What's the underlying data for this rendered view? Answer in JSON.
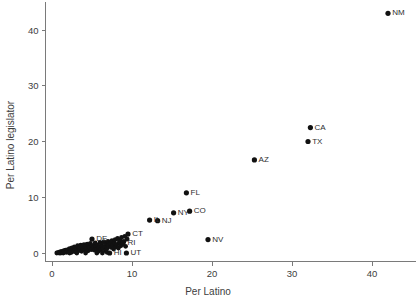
{
  "chart_data": {
    "type": "scatter",
    "title": "",
    "xlabel": "Per Latino",
    "ylabel": "Per Latino legislator",
    "xlim": [
      -0.8,
      45.5
    ],
    "ylim": [
      -1.6,
      45.0
    ],
    "xticks": [
      0,
      10,
      20,
      30,
      40
    ],
    "yticks": [
      0,
      10,
      20,
      30,
      40
    ],
    "xtick_labels": [
      "0",
      "10",
      "20",
      "30",
      "40"
    ],
    "ytick_labels": [
      "0",
      "10",
      "20",
      "30",
      "40"
    ],
    "grid": false,
    "legend": "none",
    "marker": "filled-circle",
    "marker_color": "#111111",
    "axis_color": "#7a7a7a",
    "background": "#ffffff",
    "points": [
      {
        "label": "NM",
        "x": 42.0,
        "y": 43.0
      },
      {
        "label": "CA",
        "x": 32.3,
        "y": 22.5
      },
      {
        "label": "TX",
        "x": 32.0,
        "y": 20.0
      },
      {
        "label": "AZ",
        "x": 25.3,
        "y": 16.7
      },
      {
        "label": "FL",
        "x": 16.8,
        "y": 10.8
      },
      {
        "label": "CO",
        "x": 17.2,
        "y": 7.5
      },
      {
        "label": "NY",
        "x": 15.2,
        "y": 7.2
      },
      {
        "label": "NJ",
        "x": 13.2,
        "y": 5.8
      },
      {
        "label": "IL",
        "x": 12.2,
        "y": 5.9
      },
      {
        "label": "NV",
        "x": 19.5,
        "y": 2.4
      },
      {
        "label": "CT",
        "x": 9.5,
        "y": 3.4
      },
      {
        "label": "RI",
        "x": 8.9,
        "y": 1.9
      },
      {
        "label": "DE",
        "x": 5.0,
        "y": 2.5
      },
      {
        "label": "HI",
        "x": 7.2,
        "y": 0.0
      },
      {
        "label": "UT",
        "x": 9.3,
        "y": 0.0
      }
    ],
    "unlabeled_points": [
      {
        "x": 0.6,
        "y": 0.0
      },
      {
        "x": 0.8,
        "y": 0.1
      },
      {
        "x": 0.9,
        "y": 0.0
      },
      {
        "x": 1.0,
        "y": 0.2
      },
      {
        "x": 1.1,
        "y": 0.0
      },
      {
        "x": 1.2,
        "y": 0.3
      },
      {
        "x": 1.3,
        "y": 0.1
      },
      {
        "x": 1.4,
        "y": 0.0
      },
      {
        "x": 1.5,
        "y": 0.4
      },
      {
        "x": 1.6,
        "y": 0.2
      },
      {
        "x": 1.7,
        "y": 0.5
      },
      {
        "x": 1.8,
        "y": 0.1
      },
      {
        "x": 1.9,
        "y": 0.3
      },
      {
        "x": 2.0,
        "y": 0.6
      },
      {
        "x": 2.1,
        "y": 0.2
      },
      {
        "x": 2.2,
        "y": 0.8
      },
      {
        "x": 2.3,
        "y": 0.4
      },
      {
        "x": 2.4,
        "y": 0.1
      },
      {
        "x": 2.5,
        "y": 0.9
      },
      {
        "x": 2.6,
        "y": 0.5
      },
      {
        "x": 2.7,
        "y": 0.3
      },
      {
        "x": 2.8,
        "y": 1.1
      },
      {
        "x": 2.9,
        "y": 0.6
      },
      {
        "x": 3.0,
        "y": 0.2
      },
      {
        "x": 3.1,
        "y": 0.8
      },
      {
        "x": 3.2,
        "y": 1.3
      },
      {
        "x": 3.3,
        "y": 0.4
      },
      {
        "x": 3.4,
        "y": 0.9
      },
      {
        "x": 3.5,
        "y": 0.6
      },
      {
        "x": 3.6,
        "y": 1.4
      },
      {
        "x": 3.7,
        "y": 0.3
      },
      {
        "x": 3.8,
        "y": 1.0
      },
      {
        "x": 3.9,
        "y": 0.7
      },
      {
        "x": 4.0,
        "y": 1.5
      },
      {
        "x": 4.1,
        "y": 0.5
      },
      {
        "x": 4.2,
        "y": 1.1
      },
      {
        "x": 4.3,
        "y": 0.8
      },
      {
        "x": 4.4,
        "y": 1.6
      },
      {
        "x": 4.5,
        "y": 0.4
      },
      {
        "x": 4.6,
        "y": 1.2
      },
      {
        "x": 4.7,
        "y": 0.9
      },
      {
        "x": 4.8,
        "y": 1.7
      },
      {
        "x": 4.9,
        "y": 0.6
      },
      {
        "x": 5.1,
        "y": 1.3
      },
      {
        "x": 5.2,
        "y": 1.0
      },
      {
        "x": 5.3,
        "y": 0.5
      },
      {
        "x": 5.4,
        "y": 1.8
      },
      {
        "x": 5.5,
        "y": 1.1
      },
      {
        "x": 5.6,
        "y": 0.7
      },
      {
        "x": 5.7,
        "y": 1.4
      },
      {
        "x": 5.8,
        "y": 0.3
      },
      {
        "x": 5.9,
        "y": 1.0
      },
      {
        "x": 6.0,
        "y": 1.9
      },
      {
        "x": 6.1,
        "y": 0.6
      },
      {
        "x": 6.2,
        "y": 1.5
      },
      {
        "x": 6.3,
        "y": 1.1
      },
      {
        "x": 6.4,
        "y": 0.8
      },
      {
        "x": 6.5,
        "y": 2.0
      },
      {
        "x": 6.6,
        "y": 1.2
      },
      {
        "x": 6.7,
        "y": 0.4
      },
      {
        "x": 6.8,
        "y": 1.6
      },
      {
        "x": 6.9,
        "y": 0.9
      },
      {
        "x": 7.0,
        "y": 2.1
      },
      {
        "x": 7.1,
        "y": 1.3
      },
      {
        "x": 7.3,
        "y": 1.7
      },
      {
        "x": 7.4,
        "y": 1.0
      },
      {
        "x": 7.5,
        "y": 2.2
      },
      {
        "x": 7.6,
        "y": 1.4
      },
      {
        "x": 7.7,
        "y": 0.7
      },
      {
        "x": 7.8,
        "y": 1.8
      },
      {
        "x": 7.9,
        "y": 2.4
      },
      {
        "x": 8.0,
        "y": 1.1
      },
      {
        "x": 8.1,
        "y": 1.5
      },
      {
        "x": 8.2,
        "y": 2.6
      },
      {
        "x": 8.3,
        "y": 0.9
      },
      {
        "x": 8.4,
        "y": 1.9
      },
      {
        "x": 8.5,
        "y": 2.3
      },
      {
        "x": 8.6,
        "y": 1.3
      },
      {
        "x": 8.7,
        "y": 2.8
      },
      {
        "x": 8.8,
        "y": 1.6
      },
      {
        "x": 9.0,
        "y": 2.1
      },
      {
        "x": 9.1,
        "y": 3.0
      },
      {
        "x": 9.2,
        "y": 1.2
      },
      {
        "x": 9.4,
        "y": 2.5
      },
      {
        "x": 4.2,
        "y": 0.0
      },
      {
        "x": 5.6,
        "y": 0.0
      },
      {
        "x": 6.3,
        "y": 0.0
      },
      {
        "x": 6.9,
        "y": 0.1
      },
      {
        "x": 3.1,
        "y": 0.0
      },
      {
        "x": 2.2,
        "y": 0.0
      }
    ]
  }
}
